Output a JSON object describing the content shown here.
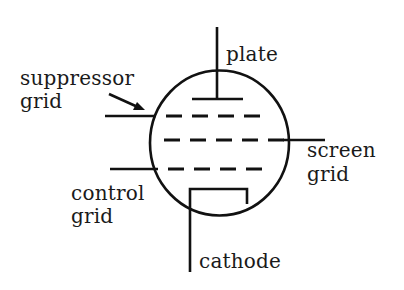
{
  "diagram": {
    "colors": {
      "ink": "#111111",
      "background": "#ffffff"
    },
    "labels": {
      "plate": "plate",
      "suppressor_line1": "suppressor",
      "suppressor_line2": "grid",
      "screen_line1": "screen",
      "screen_line2": "grid",
      "control_line1": "control",
      "control_line2": "grid",
      "cathode": "cathode"
    },
    "elements": [
      {
        "name": "envelope",
        "shape": "circle"
      },
      {
        "name": "plate",
        "shape": "T-electrode"
      },
      {
        "name": "suppressor-grid",
        "shape": "dashed-line"
      },
      {
        "name": "screen-grid",
        "shape": "dashed-line"
      },
      {
        "name": "control-grid",
        "shape": "dashed-line"
      },
      {
        "name": "cathode",
        "shape": "bracket"
      }
    ]
  }
}
